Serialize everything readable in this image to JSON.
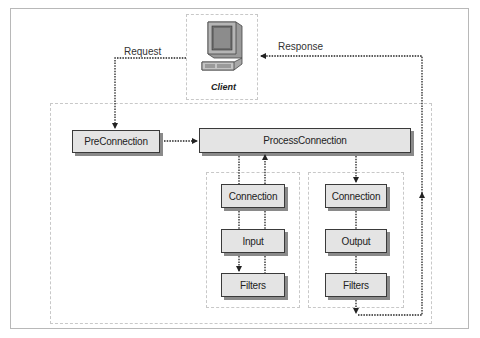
{
  "diagram": {
    "client": {
      "label": "Client",
      "icon": "computer-terminal-icon"
    },
    "edges": {
      "request": "Request",
      "response": "Response"
    },
    "nodes": {
      "pre_connection": "PreConnection",
      "process_connection": "ProcessConnection",
      "input_group": {
        "connection": "Connection",
        "input": "Input",
        "filters": "Filters"
      },
      "output_group": {
        "connection": "Connection",
        "output": "Output",
        "filters": "Filters"
      }
    },
    "colors": {
      "node_fill": "#e4e4e4",
      "node_border": "#3a3a3a",
      "node_shadow": "#8a8a8a",
      "dashed_border": "#c8c8c8",
      "arrow": "#222222"
    }
  }
}
